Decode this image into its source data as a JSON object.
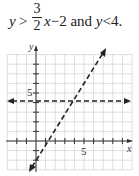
{
  "caption": {
    "lhs_var": "y",
    "op1": ">",
    "frac_num": "3",
    "frac_den": "2",
    "x_var": "x",
    "minus": "−",
    "const": "2",
    "conj": "and",
    "y_var2": "y",
    "op2": "<",
    "val2": "4."
  },
  "chart_data": {
    "type": "line",
    "xlabel": "x",
    "ylabel": "y",
    "xlim": [
      -3,
      10
    ],
    "ylim": [
      -3,
      9
    ],
    "grid": true,
    "tick_labels": {
      "x": [
        "5"
      ],
      "y": [
        "5"
      ]
    },
    "series": [
      {
        "name": "y = (3/2)x − 2",
        "style": "dashed",
        "points": [
          [
            -0.7,
            -3
          ],
          [
            7,
            8.5
          ]
        ],
        "arrows": "both"
      },
      {
        "name": "y = 4",
        "style": "dashed",
        "points": [
          [
            -3,
            4
          ],
          [
            10,
            4
          ]
        ],
        "arrows": "both"
      }
    ]
  }
}
